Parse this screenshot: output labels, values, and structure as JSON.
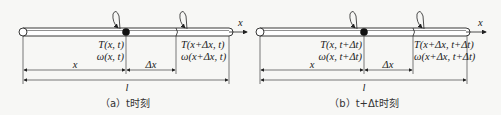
{
  "figure": {
    "panels": [
      {
        "id": "a",
        "axis_label": "x",
        "label_T_left": "T(x, t)",
        "label_w_left": "ω(x, t)",
        "label_T_right": "T(x+Δx, t)",
        "label_w_right": "ω(x+Δx, t)",
        "dim_x": "x",
        "dim_dx": "Δx",
        "dim_l": "l",
        "caption": "（a）t时刻"
      },
      {
        "id": "b",
        "axis_label": "x",
        "label_T_left": "T(x, t+Δt)",
        "label_w_left": "ω(x, t+Δt)",
        "label_T_right": "T(x+Δx, t+Δt)",
        "label_w_right": "ω(x+Δx, t+Δt)",
        "dim_x": "x",
        "dim_dx": "Δx",
        "dim_l": "l",
        "caption": "（b）t+Δt时刻"
      }
    ]
  }
}
